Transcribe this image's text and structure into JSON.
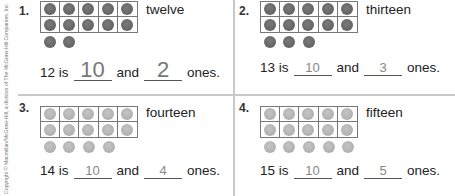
{
  "copyright": "Copyright © Macmillan/McGraw-Hill, a division of The McGraw-Hill Companies, Inc.",
  "colors": {
    "dark_counter": "#656565",
    "light_counter": "#b5b5b5",
    "divider": "#c8c8c8",
    "answer_text": "#888888"
  },
  "problems": [
    {
      "number": "1.",
      "word": "twelve",
      "total": "12",
      "frame_dots": 10,
      "extra_dots": 2,
      "dot_shade": "dark",
      "sentence": {
        "lead": "12 is",
        "tens_answer": "10",
        "mid": "and",
        "ones_answer": "2",
        "tail": "ones."
      }
    },
    {
      "number": "2.",
      "word": "thirteen",
      "total": "13",
      "frame_dots": 10,
      "extra_dots": 3,
      "dot_shade": "dark",
      "sentence": {
        "lead": "13 is",
        "tens_answer": "10",
        "mid": "and",
        "ones_answer": "3",
        "tail": "ones."
      }
    },
    {
      "number": "3.",
      "word": "fourteen",
      "total": "14",
      "frame_dots": 10,
      "extra_dots": 4,
      "dot_shade": "light",
      "sentence": {
        "lead": "14 is",
        "tens_answer": "10",
        "mid": "and",
        "ones_answer": "4",
        "tail": "ones."
      }
    },
    {
      "number": "4.",
      "word": "fifteen",
      "total": "15",
      "frame_dots": 10,
      "extra_dots": 5,
      "dot_shade": "light",
      "sentence": {
        "lead": "15 is",
        "tens_answer": "10",
        "mid": "and",
        "ones_answer": "5",
        "tail": "ones."
      }
    }
  ]
}
